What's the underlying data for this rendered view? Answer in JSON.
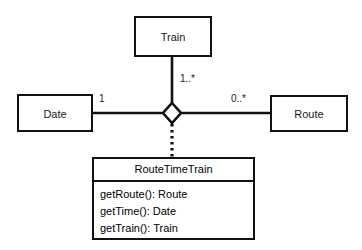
{
  "diagram": {
    "type": "uml-class-diagram",
    "notation": "association class with aggregation diamond",
    "colors": {
      "background": "#ffffff",
      "stroke": "#111111",
      "text": "#1a1a1a"
    },
    "classes": [
      {
        "id": "train",
        "name": "Train",
        "x": 134,
        "y": 16,
        "width": 78,
        "height": 41
      },
      {
        "id": "date",
        "name": "Date",
        "x": 17,
        "y": 94,
        "width": 76,
        "height": 38
      },
      {
        "id": "route",
        "name": "Route",
        "x": 270,
        "y": 95,
        "width": 78,
        "height": 37
      }
    ],
    "association_class": {
      "id": "routetimetrain",
      "name": "RouteTimeTrain",
      "x": 92,
      "y": 157,
      "width": 163,
      "height": 83,
      "methods": [
        "getRoute(): Route",
        "getTime(): Date",
        "getTrain(): Train"
      ]
    },
    "diamond": {
      "center_x": 172,
      "center_y": 113,
      "half_width": 9,
      "half_height": 10,
      "filled": false
    },
    "multiplicities": [
      {
        "id": "date-end",
        "label": "1",
        "x": 99,
        "y": 93
      },
      {
        "id": "train-end",
        "label": "1..*",
        "x": 180,
        "y": 73
      },
      {
        "id": "route-end",
        "label": "0..*",
        "x": 231,
        "y": 93
      }
    ],
    "connectors": [
      {
        "id": "date-to-diamond",
        "style": "solid",
        "from": "date",
        "to": "diamond"
      },
      {
        "id": "train-to-diamond",
        "style": "solid",
        "from": "train",
        "to": "diamond"
      },
      {
        "id": "route-to-diamond",
        "style": "solid",
        "from": "route",
        "to": "diamond"
      },
      {
        "id": "diamond-to-association-class",
        "style": "dotted",
        "from": "diamond",
        "to": "routetimetrain"
      }
    ]
  }
}
